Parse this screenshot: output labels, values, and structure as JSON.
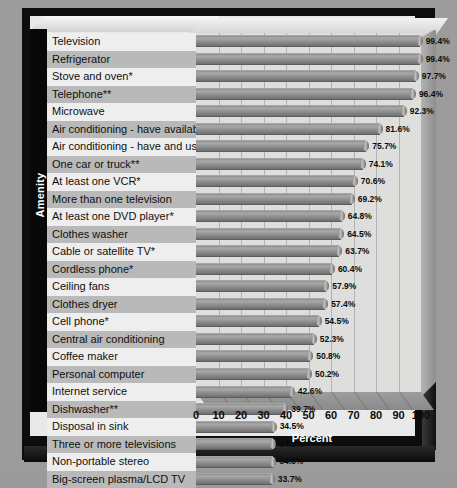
{
  "chart_data": {
    "type": "bar",
    "orientation": "horizontal",
    "title": "",
    "xlabel": "Percent",
    "ylabel": "Amenity",
    "xlim": [
      0,
      100
    ],
    "xticks": [
      0,
      10,
      20,
      30,
      40,
      50,
      60,
      70,
      80,
      90,
      100
    ],
    "grid": true,
    "legend": false,
    "categories": [
      "Television",
      "Refrigerator",
      "Stove and oven*",
      "Telephone**",
      "Microwave",
      "Air conditioning - have available",
      "Air conditioning - have and use",
      "One car or truck**",
      "At least one VCR*",
      "More than one television",
      "At least one DVD player*",
      "Clothes washer",
      "Cable or satellite TV*",
      "Cordless phone*",
      "Ceiling fans",
      "Clothes dryer",
      "Cell phone*",
      "Central air conditioning",
      "Coffee maker",
      "Personal computer",
      "Internet service",
      "Dishwasher**",
      "Disposal in sink",
      "Three or more televisions",
      "Non-portable stereo",
      "Big-screen plasma/LCD TV"
    ],
    "values": [
      99.4,
      99.4,
      97.7,
      96.4,
      92.3,
      81.6,
      75.7,
      74.1,
      70.6,
      69.2,
      64.8,
      64.5,
      63.7,
      60.4,
      57.9,
      57.4,
      54.5,
      52.3,
      50.8,
      50.2,
      42.6,
      39.7,
      34.5,
      34.3,
      34.3,
      33.7
    ],
    "data_labels": [
      "99.4%",
      "99.4%",
      "97.7%",
      "96.4%",
      "92.3%",
      "81.6%",
      "75.7%",
      "74.1%",
      "70.6%",
      "69.2%",
      "64.8%",
      "64.5%",
      "63.7%",
      "60.4%",
      "57.9%",
      "57.4%",
      "54.5%",
      "52.3%",
      "50.8%",
      "50.2%",
      "42.6%",
      "39.7%",
      "34.5%",
      "34.3%",
      "34.3%",
      "33.7%"
    ]
  },
  "colors": {
    "background": "#9c9c9c",
    "frame": "#0d0d0d",
    "plot_area": "#dededd",
    "bar": "#8f8f8f",
    "row_band_alt": "#b9b9b9",
    "row_band": "#eeeeee",
    "axis_text": "#0b0b0b",
    "axis_title_text": "#ffffff"
  }
}
